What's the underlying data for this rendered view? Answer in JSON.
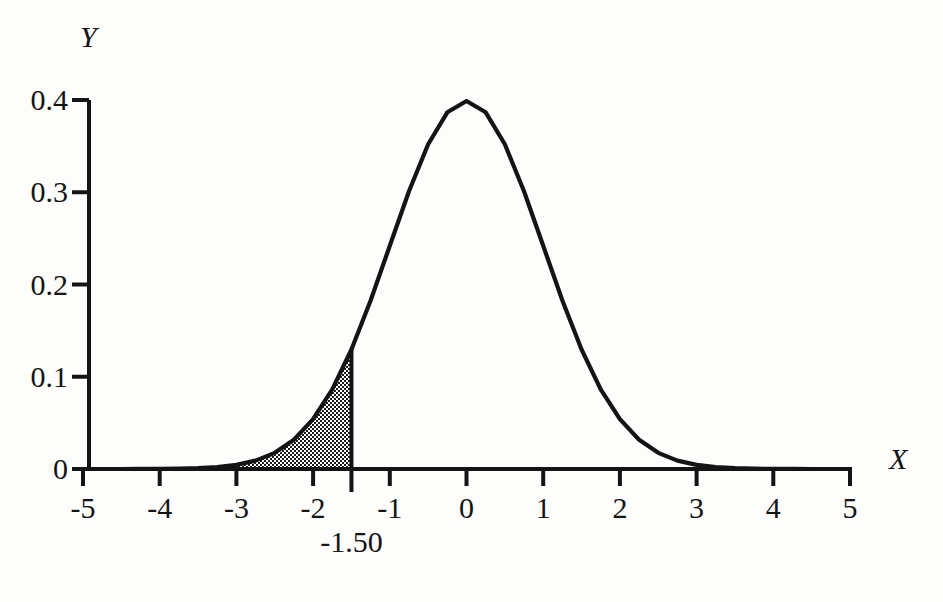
{
  "figure": {
    "background_color": "#fdfdfc",
    "ink_color": "#141414"
  },
  "axes": {
    "y_axis_name": "Y",
    "x_axis_name": "X"
  },
  "marker": {
    "label": "-1.50",
    "value": -1.5
  },
  "chart_data": {
    "type": "line",
    "title": "",
    "subtitle": "",
    "xlabel": "X",
    "ylabel": "Y",
    "xlim": [
      -5,
      5
    ],
    "ylim": [
      0,
      0.4
    ],
    "grid": false,
    "legend": null,
    "x_ticks": [
      -5,
      -4,
      -3,
      -2,
      -1,
      0,
      1,
      2,
      3,
      4,
      5
    ],
    "x_tick_labels": [
      "-5",
      "-4",
      "-3",
      "-2",
      "-1",
      "0",
      "1",
      "2",
      "3",
      "4",
      "5"
    ],
    "y_ticks": [
      0,
      0.1,
      0.2,
      0.3,
      0.4
    ],
    "y_tick_labels": [
      "0",
      "0.1",
      "0.2",
      "0.3",
      "0.4"
    ],
    "series": [
      {
        "name": "standard normal density",
        "type": "line",
        "x": [
          -5,
          -4.75,
          -4.5,
          -4.25,
          -4,
          -3.75,
          -3.5,
          -3.25,
          -3,
          -2.75,
          -2.5,
          -2.25,
          -2,
          -1.75,
          -1.5,
          -1.25,
          -1,
          -0.75,
          -0.5,
          -0.25,
          0,
          0.25,
          0.5,
          0.75,
          1,
          1.25,
          1.5,
          1.75,
          2,
          2.25,
          2.5,
          2.75,
          3,
          3.25,
          3.5,
          3.75,
          4,
          4.25,
          4.5,
          4.75,
          5
        ],
        "y": [
          1.5e-06,
          5.7e-06,
          1.6e-05,
          4.27e-05,
          0.0001338,
          0.0003461,
          0.0008727,
          0.0020372,
          0.0044318,
          0.0090936,
          0.0175283,
          0.0316579,
          0.053991,
          0.0862773,
          0.1295176,
          0.1826491,
          0.2419707,
          0.3011374,
          0.3520653,
          0.3866681,
          0.3989423,
          0.3866681,
          0.3520653,
          0.3011374,
          0.2419707,
          0.1826491,
          0.1295176,
          0.0862773,
          0.053991,
          0.0316579,
          0.0175283,
          0.0090936,
          0.0044318,
          0.0020372,
          0.0008727,
          0.0003461,
          0.0001338,
          4.27e-05,
          1.6e-05,
          5.7e-06,
          1.5e-06
        ]
      }
    ],
    "annotations": [
      {
        "kind": "vertical-line",
        "x": -1.5,
        "label": "-1.50",
        "y_top": 0.1295176
      },
      {
        "kind": "shaded-area",
        "fill": "checkerboard-hatch",
        "x_from": -5,
        "x_to": -1.5,
        "description": "lower tail area under the normal curve left of -1.50"
      }
    ],
    "peak": {
      "x": 0,
      "y": 0.3989423
    }
  }
}
